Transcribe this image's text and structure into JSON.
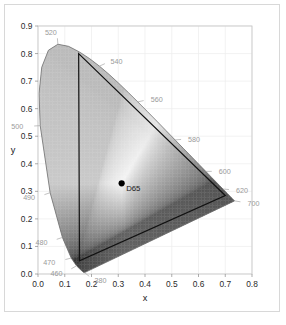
{
  "figure": {
    "name": "cie-1931-chromaticity-diagram",
    "background_color": "#ffffff",
    "border_color": "#d8d8d8"
  },
  "chart_data": {
    "type": "scatter",
    "title": "",
    "subtitle": "",
    "xlabel": "x",
    "ylabel": "y",
    "xlim": [
      0.0,
      0.8
    ],
    "ylim": [
      0.0,
      0.9
    ],
    "grid": true,
    "legend": "none",
    "x_ticks": [
      "0.0",
      "0.1",
      "0.2",
      "0.3",
      "0.4",
      "0.5",
      "0.6",
      "0.7",
      "0.8"
    ],
    "x_tick_values": [
      0.0,
      0.1,
      0.2,
      0.3,
      0.4,
      0.5,
      0.6,
      0.7,
      0.8
    ],
    "y_ticks": [
      "0.0",
      "0.1",
      "0.2",
      "0.3",
      "0.4",
      "0.5",
      "0.6",
      "0.7",
      "0.8",
      "0.9"
    ],
    "y_tick_values": [
      0.0,
      0.1,
      0.2,
      0.3,
      0.4,
      0.5,
      0.6,
      0.7,
      0.8,
      0.9
    ],
    "annotations": [
      {
        "label": "D65",
        "x": 0.3127,
        "y": 0.329,
        "marker": "filled-circle",
        "color": "#000000"
      }
    ],
    "wavelength_labels": [
      {
        "label": "520",
        "x": 0.0743,
        "y": 0.8338,
        "label_dx": -1,
        "label_dy": -12
      },
      {
        "label": "540",
        "x": 0.2296,
        "y": 0.7543,
        "label_dx": 11,
        "label_dy": -5
      },
      {
        "label": "560",
        "x": 0.3731,
        "y": 0.6245,
        "label_dx": 13,
        "label_dy": -3
      },
      {
        "label": "580",
        "x": 0.5125,
        "y": 0.4866,
        "label_dx": 13,
        "label_dy": -1
      },
      {
        "label": "600",
        "x": 0.627,
        "y": 0.3725,
        "label_dx": 13,
        "label_dy": 0
      },
      {
        "label": "620",
        "x": 0.6915,
        "y": 0.3083,
        "label_dx": 13,
        "label_dy": 1
      },
      {
        "label": "700",
        "x": 0.7347,
        "y": 0.2653,
        "label_dx": 13,
        "label_dy": 2
      },
      {
        "label": "500",
        "x": 0.0082,
        "y": 0.5384,
        "label_dx": -17,
        "label_dy": 1
      },
      {
        "label": "490",
        "x": 0.0454,
        "y": 0.295,
        "label_dx": -15,
        "label_dy": 5
      },
      {
        "label": "480",
        "x": 0.0913,
        "y": 0.1327,
        "label_dx": -15,
        "label_dy": 5
      },
      {
        "label": "470",
        "x": 0.1241,
        "y": 0.0578,
        "label_dx": -16,
        "label_dy": 4
      },
      {
        "label": "460",
        "x": 0.144,
        "y": 0.0297,
        "label_dx": -14,
        "label_dy": 8
      },
      {
        "label": "380",
        "x": 0.1741,
        "y": 0.005,
        "label_dx": 10,
        "label_dy": 8
      }
    ],
    "gamut_triangle": {
      "name": "srgb-gamut",
      "vertices": [
        {
          "name": "red-primary",
          "x": 0.7,
          "y": 0.285
        },
        {
          "name": "green-primary",
          "x": 0.152,
          "y": 0.8
        },
        {
          "name": "blue-primary",
          "x": 0.155,
          "y": 0.048
        }
      ]
    },
    "spectral_locus": [
      {
        "wl": 380,
        "x": 0.1741,
        "y": 0.005
      },
      {
        "wl": 390,
        "x": 0.1738,
        "y": 0.0049
      },
      {
        "wl": 400,
        "x": 0.1733,
        "y": 0.0048
      },
      {
        "wl": 410,
        "x": 0.1726,
        "y": 0.0048
      },
      {
        "wl": 420,
        "x": 0.1714,
        "y": 0.0051
      },
      {
        "wl": 430,
        "x": 0.1689,
        "y": 0.0069
      },
      {
        "wl": 440,
        "x": 0.1644,
        "y": 0.0109
      },
      {
        "wl": 450,
        "x": 0.1566,
        "y": 0.0177
      },
      {
        "wl": 460,
        "x": 0.144,
        "y": 0.0297
      },
      {
        "wl": 470,
        "x": 0.1241,
        "y": 0.0578
      },
      {
        "wl": 480,
        "x": 0.0913,
        "y": 0.1327
      },
      {
        "wl": 490,
        "x": 0.0454,
        "y": 0.295
      },
      {
        "wl": 500,
        "x": 0.0082,
        "y": 0.5384
      },
      {
        "wl": 505,
        "x": 0.0039,
        "y": 0.6548
      },
      {
        "wl": 510,
        "x": 0.0139,
        "y": 0.7502
      },
      {
        "wl": 515,
        "x": 0.0389,
        "y": 0.812
      },
      {
        "wl": 520,
        "x": 0.0743,
        "y": 0.8338
      },
      {
        "wl": 525,
        "x": 0.1142,
        "y": 0.8262
      },
      {
        "wl": 530,
        "x": 0.1547,
        "y": 0.8059
      },
      {
        "wl": 535,
        "x": 0.1929,
        "y": 0.7816
      },
      {
        "wl": 540,
        "x": 0.2296,
        "y": 0.7543
      },
      {
        "wl": 545,
        "x": 0.2658,
        "y": 0.7243
      },
      {
        "wl": 550,
        "x": 0.3016,
        "y": 0.6923
      },
      {
        "wl": 555,
        "x": 0.3373,
        "y": 0.6589
      },
      {
        "wl": 560,
        "x": 0.3731,
        "y": 0.6245
      },
      {
        "wl": 565,
        "x": 0.4087,
        "y": 0.5896
      },
      {
        "wl": 570,
        "x": 0.4441,
        "y": 0.5547
      },
      {
        "wl": 575,
        "x": 0.4788,
        "y": 0.5202
      },
      {
        "wl": 580,
        "x": 0.5125,
        "y": 0.4866
      },
      {
        "wl": 585,
        "x": 0.5448,
        "y": 0.4544
      },
      {
        "wl": 590,
        "x": 0.5752,
        "y": 0.4242
      },
      {
        "wl": 595,
        "x": 0.6029,
        "y": 0.3965
      },
      {
        "wl": 600,
        "x": 0.627,
        "y": 0.3725
      },
      {
        "wl": 605,
        "x": 0.6482,
        "y": 0.3514
      },
      {
        "wl": 610,
        "x": 0.6658,
        "y": 0.334
      },
      {
        "wl": 615,
        "x": 0.6801,
        "y": 0.3197
      },
      {
        "wl": 620,
        "x": 0.6915,
        "y": 0.3083
      },
      {
        "wl": 630,
        "x": 0.7079,
        "y": 0.292
      },
      {
        "wl": 640,
        "x": 0.719,
        "y": 0.2809
      },
      {
        "wl": 650,
        "x": 0.726,
        "y": 0.274
      },
      {
        "wl": 660,
        "x": 0.73,
        "y": 0.27
      },
      {
        "wl": 680,
        "x": 0.7334,
        "y": 0.2666
      },
      {
        "wl": 700,
        "x": 0.7347,
        "y": 0.2653
      }
    ]
  }
}
